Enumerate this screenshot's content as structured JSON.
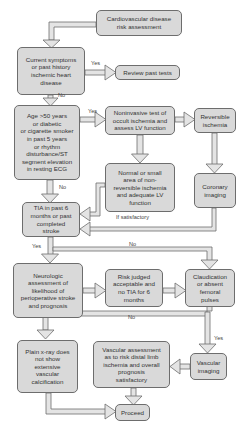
{
  "diagram": {
    "type": "flowchart",
    "colors": {
      "box_fill": "#d9d9d9",
      "box_border": "#6d6d6d",
      "arrow_fill": "#e4e4e4",
      "arrow_stroke": "#6d6d6d",
      "text": "#333333",
      "background": "#ffffff"
    },
    "nodes": {
      "cv_risk": "Cardiovascular disease\nrisk assessment",
      "current_symptoms": "Current symptoms\nor past history\nischemic heart\ndisease",
      "review_tests": "Review past tests",
      "age": "Age >50 years\nor diabetic\nor cigarette smoker\nin past 5 years\nor rhythm\ndisturbance/ST\nsegment elevation\nin resting ECG",
      "noninvasive": "Noninvasive test of\noccult ischemia and\nassess LV function",
      "reversible": "Reversible\nischemia",
      "normal_small": "Normal or small\narea of non-\nreversible ischemia\nand adequate LV\nfunction",
      "coronary": "Coronary\nimaging",
      "tia": "TIA in past 6\nmonths or past\ncompleted\nstroke",
      "neurologic": "Neurologic\nassessment of\nlikelihood of\nperioperative stroke\nand prognosis",
      "risk_judged": "Risk judged\nacceptable and\nno TIA for 6\nmonths",
      "claudication": "Claudication\nor absent\nfemoral\npulses",
      "plain_xray": "Plain x-ray does\nnot show\nextensive\nvascular\ncalcification",
      "vascular_assessment": "Vascular assessment\nas to risk distal limb\nischemia and overall\nprognosis\nsatisfactory",
      "vascular_imaging": "Vascular\nimaging",
      "proceed": "Proceed"
    },
    "labels": {
      "yes_symptoms": "Yes",
      "no_symptoms": "No",
      "yes_age": "Yes",
      "no_age": "No",
      "if_satisfactory": "If satisfactory",
      "yes_tia": "Yes",
      "no_tia": "No",
      "no_claudication": "No",
      "yes_claudication": "Yes"
    },
    "edges": [
      {
        "from": "cv_risk",
        "to": "current_symptoms"
      },
      {
        "from": "current_symptoms",
        "to": "review_tests",
        "label": "Yes"
      },
      {
        "from": "current_symptoms",
        "to": "age",
        "label": "No"
      },
      {
        "from": "age",
        "to": "noninvasive",
        "label": "Yes"
      },
      {
        "from": "age",
        "to": "tia",
        "label": "No"
      },
      {
        "from": "noninvasive",
        "to": "reversible"
      },
      {
        "from": "noninvasive",
        "to": "normal_small"
      },
      {
        "from": "reversible",
        "to": "coronary"
      },
      {
        "from": "normal_small",
        "to": "tia"
      },
      {
        "from": "coronary",
        "to": "tia",
        "label": "If satisfactory"
      },
      {
        "from": "tia",
        "to": "neurologic",
        "label": "Yes"
      },
      {
        "from": "tia",
        "to": "claudication",
        "label": "No"
      },
      {
        "from": "neurologic",
        "to": "risk_judged"
      },
      {
        "from": "risk_judged",
        "to": "claudication"
      },
      {
        "from": "claudication",
        "to": "plain_xray",
        "label": "No"
      },
      {
        "from": "claudication",
        "to": "vascular_imaging",
        "label": "Yes"
      },
      {
        "from": "vascular_imaging",
        "to": "vascular_assessment"
      },
      {
        "from": "vascular_assessment",
        "to": "proceed"
      },
      {
        "from": "plain_xray",
        "to": "proceed"
      }
    ]
  }
}
